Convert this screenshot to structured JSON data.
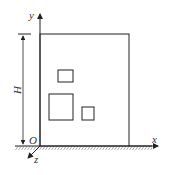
{
  "diagram": {
    "axes": {
      "x_label": "x",
      "y_label": "y",
      "z_label": "z",
      "origin_label": "O"
    },
    "dimension": {
      "label": "H"
    },
    "colors": {
      "stroke": "#222222",
      "background": "#ffffff"
    },
    "shapes": {
      "wall": {
        "x": 40,
        "y": 34,
        "w": 89,
        "h": 112
      },
      "openings": [
        {
          "x": 58,
          "y": 70,
          "w": 15,
          "h": 12
        },
        {
          "x": 49,
          "y": 94,
          "w": 24,
          "h": 26
        },
        {
          "x": 82,
          "y": 107,
          "w": 12,
          "h": 13
        }
      ]
    }
  }
}
